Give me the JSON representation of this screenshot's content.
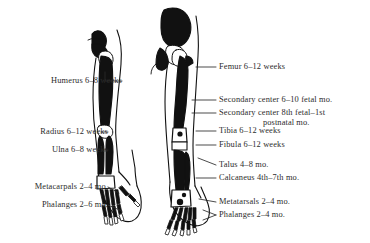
{
  "figure": {
    "background_color": "#ffffff",
    "ink_color": "#111111",
    "text_color": "#2b2b2b"
  },
  "labels_left": [
    {
      "id": "humerus",
      "text": "Humerus 6–8 weeks",
      "x": 124,
      "y": 84,
      "leader_to_x": 150,
      "leader_to_y": 84
    },
    {
      "id": "radius",
      "text": "Radius 6–12 weeks",
      "x": 110,
      "y": 135,
      "leader_to_x": 150,
      "leader_to_y": 135
    },
    {
      "id": "ulna",
      "text": "Ulna 6–8 weeks",
      "x": 110,
      "y": 153,
      "leader_to_x": 150,
      "leader_to_y": 153
    },
    {
      "id": "metacarpals",
      "text": "Metacarpals 2–4 mo.",
      "x": 110,
      "y": 190,
      "leader_to_x": 150,
      "leader_to_y": 190
    },
    {
      "id": "phalanges",
      "text": "Phalanges 2–6 mo.",
      "x": 110,
      "y": 208,
      "leader_to_x": 150,
      "leader_to_y": 208
    }
  ],
  "labels_right": [
    {
      "id": "femur",
      "text": "Femur 6–12 weeks",
      "x": 218,
      "y": 70
    },
    {
      "id": "secondary-center-1",
      "text": "Secondary center 6–10 fetal mo.",
      "x": 218,
      "y": 103
    },
    {
      "id": "secondary-center-2",
      "text": "Secondary center 8th fetal–1st",
      "x": 218,
      "y": 116
    },
    {
      "id": "secondary-center-2b",
      "text": "postnatal mo.",
      "x": 262,
      "y": 126
    },
    {
      "id": "tibia",
      "text": "Tibia 6–12 weeks",
      "x": 218,
      "y": 134
    },
    {
      "id": "fibula",
      "text": "Fibula 6–12 weeks",
      "x": 218,
      "y": 148
    },
    {
      "id": "talus",
      "text": "Talus 4–8 mo.",
      "x": 218,
      "y": 168
    },
    {
      "id": "calcaneus",
      "text": "Calcaneus 4th–7th mo.",
      "x": 218,
      "y": 181
    },
    {
      "id": "metatarsals",
      "text": "Metatarsals 2–4 mo.",
      "x": 218,
      "y": 205
    },
    {
      "id": "phalanges-foot",
      "text": "Phalanges 2–4 mo.",
      "x": 218,
      "y": 218
    }
  ],
  "illustrations": [
    {
      "id": "upper-limb",
      "name": "arm-skeleton-illustration",
      "description": "Upper limb: humerus, radius, ulna, carpals, metacarpals, phalanges"
    },
    {
      "id": "lower-limb",
      "name": "leg-skeleton-illustration",
      "description": "Lower limb: pelvis, femur, tibia, fibula, talus, calcaneus, metatarsals, phalanges"
    }
  ]
}
